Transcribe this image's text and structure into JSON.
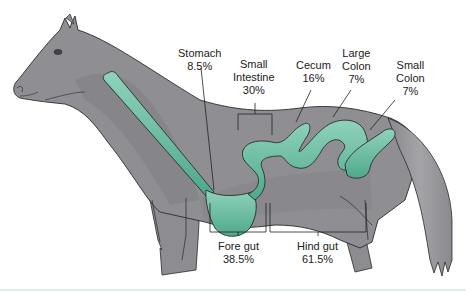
{
  "diagram": {
    "colors": {
      "body": "#8f8f93",
      "body_shadow": "#7e7e83",
      "body_highlight": "#a1a1a5",
      "gut": "#5fb79a",
      "gut_light": "#8fd2bb",
      "outline": "#2a2a2a",
      "leader": "#222222"
    },
    "organs": [
      {
        "id": "stomach",
        "name": "Stomach",
        "percent": "8.5%"
      },
      {
        "id": "small-intestine",
        "name_line1": "Small",
        "name_line2": "Intestine",
        "percent": "30%"
      },
      {
        "id": "cecum",
        "name": "Cecum",
        "percent": "16%"
      },
      {
        "id": "large-colon",
        "name_line1": "Large",
        "name_line2": "Colon",
        "percent": "7%"
      },
      {
        "id": "small-colon",
        "name_line1": "Small",
        "name_line2": "Colon",
        "percent": "7%"
      }
    ],
    "sections": [
      {
        "id": "fore-gut",
        "name": "Fore gut",
        "percent": "38.5%"
      },
      {
        "id": "hind-gut",
        "name": "Hind gut",
        "percent": "61.5%"
      }
    ]
  }
}
